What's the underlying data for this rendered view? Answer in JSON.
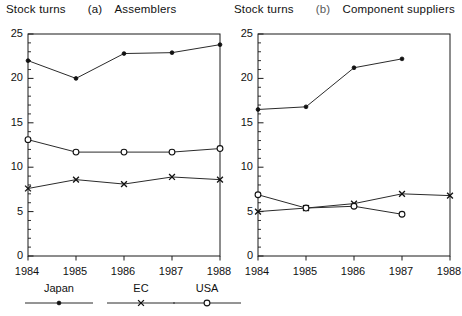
{
  "chart_data": [
    {
      "type": "line",
      "panel_id": "(a)",
      "title": "Assemblers",
      "ylabel": "Stock turns",
      "xlabel": "",
      "categories": [
        "1984",
        "1985",
        "1986",
        "1987",
        "1988"
      ],
      "x": [
        1984,
        1985,
        1986,
        1987,
        1988
      ],
      "ylim": [
        0,
        25
      ],
      "yticks": [
        0,
        5,
        10,
        15,
        20,
        25
      ],
      "ytick_labels": [
        "0",
        "5",
        "10",
        "15",
        "20",
        "25"
      ],
      "yminor_step": 1,
      "grid": false,
      "legend_position": "below",
      "series": [
        {
          "name": "Japan",
          "marker": "filled-dot",
          "values": [
            22.0,
            20.0,
            22.8,
            22.9,
            23.8
          ]
        },
        {
          "name": "EC",
          "marker": "x",
          "values": [
            7.6,
            8.6,
            8.1,
            8.9,
            8.6
          ]
        },
        {
          "name": "USA",
          "marker": "open-circle",
          "values": [
            13.1,
            11.7,
            11.7,
            11.7,
            12.1
          ]
        }
      ]
    },
    {
      "type": "line",
      "panel_id": "(b)",
      "title": "Component suppliers",
      "ylabel": "Stock turns",
      "xlabel": "",
      "categories": [
        "1984",
        "1985",
        "1986",
        "1987",
        "1988"
      ],
      "x": [
        1984,
        1985,
        1986,
        1987,
        1988
      ],
      "ylim": [
        0,
        25
      ],
      "yticks": [
        0,
        5,
        10,
        15,
        20,
        25
      ],
      "ytick_labels": [
        "0",
        "5",
        "10",
        "15",
        "20",
        "25"
      ],
      "yminor_step": 1,
      "grid": false,
      "legend_position": "below",
      "series": [
        {
          "name": "Japan",
          "marker": "filled-dot",
          "values": [
            16.5,
            16.8,
            21.2,
            22.2,
            null
          ]
        },
        {
          "name": "EC",
          "marker": "x",
          "values": [
            5.0,
            5.4,
            5.9,
            7.0,
            6.8
          ]
        },
        {
          "name": "USA",
          "marker": "open-circle",
          "values": [
            6.9,
            5.4,
            5.6,
            4.7,
            null
          ]
        }
      ]
    }
  ],
  "panel_a": {
    "ylabel": "Stock turns",
    "panel_id": "(a)",
    "title": "Assemblers"
  },
  "panel_b": {
    "ylabel": "Stock turns",
    "panel_id": "(b)",
    "title": "Component suppliers"
  },
  "legend": {
    "items": [
      {
        "label": "Japan",
        "marker": "filled-dot"
      },
      {
        "label": "EC",
        "marker": "x"
      },
      {
        "label": "USA",
        "marker": "open-circle"
      }
    ]
  }
}
